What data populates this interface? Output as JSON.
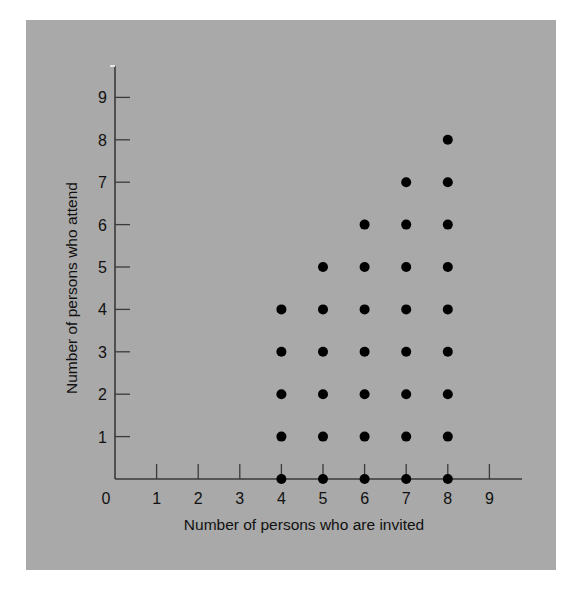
{
  "chart_data": {
    "type": "scatter",
    "title": "",
    "xlabel": "Number of persons who are invited",
    "ylabel": "Number of persons who attend",
    "xlim": [
      0,
      9
    ],
    "ylim": [
      0,
      9
    ],
    "x_ticks": [
      0,
      1,
      2,
      3,
      4,
      5,
      6,
      7,
      8,
      9
    ],
    "y_ticks": [
      1,
      2,
      3,
      4,
      5,
      6,
      7,
      8,
      9
    ],
    "grid": false,
    "legend": null,
    "marker_color": "#000000",
    "background_color": "#a9a9a9",
    "points": [
      {
        "x": 4,
        "y": 0
      },
      {
        "x": 4,
        "y": 1
      },
      {
        "x": 4,
        "y": 2
      },
      {
        "x": 4,
        "y": 3
      },
      {
        "x": 4,
        "y": 4
      },
      {
        "x": 5,
        "y": 0
      },
      {
        "x": 5,
        "y": 1
      },
      {
        "x": 5,
        "y": 2
      },
      {
        "x": 5,
        "y": 3
      },
      {
        "x": 5,
        "y": 4
      },
      {
        "x": 5,
        "y": 5
      },
      {
        "x": 6,
        "y": 0
      },
      {
        "x": 6,
        "y": 1
      },
      {
        "x": 6,
        "y": 2
      },
      {
        "x": 6,
        "y": 3
      },
      {
        "x": 6,
        "y": 4
      },
      {
        "x": 6,
        "y": 5
      },
      {
        "x": 6,
        "y": 6
      },
      {
        "x": 7,
        "y": 0
      },
      {
        "x": 7,
        "y": 1
      },
      {
        "x": 7,
        "y": 2
      },
      {
        "x": 7,
        "y": 3
      },
      {
        "x": 7,
        "y": 4
      },
      {
        "x": 7,
        "y": 5
      },
      {
        "x": 7,
        "y": 6
      },
      {
        "x": 7,
        "y": 7
      },
      {
        "x": 8,
        "y": 0
      },
      {
        "x": 8,
        "y": 1
      },
      {
        "x": 8,
        "y": 2
      },
      {
        "x": 8,
        "y": 3
      },
      {
        "x": 8,
        "y": 4
      },
      {
        "x": 8,
        "y": 5
      },
      {
        "x": 8,
        "y": 6
      },
      {
        "x": 8,
        "y": 7
      },
      {
        "x": 8,
        "y": 8
      }
    ]
  }
}
